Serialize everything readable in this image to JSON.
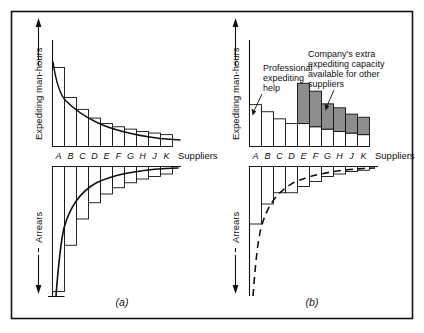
{
  "figure": {
    "frame": {
      "stroke": "#111111"
    },
    "panels": [
      {
        "id": "panel-a",
        "caption": "(a)",
        "top_chart": {
          "ylabel": "Expediting man-hours",
          "xlabel": "Suppliers",
          "categories": [
            "A",
            "B",
            "C",
            "D",
            "E",
            "F",
            "G",
            "H",
            "J",
            "K"
          ],
          "values": [
            100,
            62,
            47,
            36,
            29,
            25,
            22,
            19,
            17,
            15
          ],
          "curve": "smooth decreasing hyperbola overlaying bar tops",
          "type": "bar"
        },
        "bottom_chart": {
          "ylabel": "Arrears",
          "categories": [
            "A",
            "B",
            "C",
            "D",
            "E",
            "F",
            "G",
            "H",
            "J",
            "K"
          ],
          "values": [
            100,
            63,
            42,
            29,
            22,
            17,
            13,
            10,
            8,
            6
          ],
          "curve": "smooth decreasing hyperbola overlaying bar tips",
          "direction": "downward",
          "type": "bar"
        }
      },
      {
        "id": "panel-b",
        "caption": "(b)",
        "top_chart": {
          "ylabel": "Expediting man-hours",
          "xlabel": "Suppliers",
          "categories": [
            "A",
            "B",
            "C",
            "D",
            "E",
            "F",
            "G",
            "H",
            "J",
            "K"
          ],
          "base_values": [
            53,
            44,
            35,
            29,
            29,
            25,
            22,
            19,
            17,
            15
          ],
          "extra_values": [
            0,
            0,
            0,
            0,
            51,
            45,
            32,
            30,
            24,
            22
          ],
          "stack_legend": {
            "base": "expediting man-hours used",
            "extra": "Company's extra expediting capacity available for other suppliers"
          },
          "annotations": [
            {
              "name": "professional-expediting-help",
              "text": "Professional\nexpediting\nhelp",
              "lines": [
                "Professional",
                "expediting",
                "help"
              ],
              "target_bar": "A"
            },
            {
              "name": "companys-extra-capacity",
              "text": "Company's extra expediting capacity available for other suppliers",
              "lines": [
                "Company's extra",
                "expediting capacity",
                "available for other",
                "suppliers"
              ],
              "target_bar": "G"
            }
          ],
          "type": "bar"
        },
        "bottom_chart": {
          "ylabel": "Arrears",
          "categories": [
            "A",
            "B",
            "C",
            "D",
            "E",
            "F",
            "G",
            "H",
            "J",
            "K"
          ],
          "values": [
            46,
            30,
            21,
            21,
            16,
            12,
            8,
            6,
            4,
            3
          ],
          "reference_curve": {
            "style": "dashed",
            "label": "original arrears curve from (a)",
            "values": [
              100,
              63,
              42,
              29,
              22,
              17,
              13,
              10,
              8,
              6
            ]
          },
          "direction": "downward",
          "type": "bar"
        }
      }
    ],
    "colors": {
      "line": "#111111",
      "bar_fill": "#ffffff",
      "shaded_fill": "#8d8d8d",
      "background": "#ffffff"
    }
  },
  "chart_data": [
    {
      "type": "bar",
      "title": "(a) Expediting man-hours by supplier",
      "xlabel": "Suppliers",
      "ylabel": "Expediting man-hours",
      "categories": [
        "A",
        "B",
        "C",
        "D",
        "E",
        "F",
        "G",
        "H",
        "J",
        "K"
      ],
      "values": [
        100,
        62,
        47,
        36,
        29,
        25,
        22,
        19,
        17,
        15
      ],
      "ylim": [
        0,
        110
      ],
      "grid": false,
      "legend": "none",
      "annotations": [
        "smooth fitted decay curve over bar tops"
      ]
    },
    {
      "type": "bar",
      "title": "(a) Arrears by supplier",
      "xlabel": "Suppliers",
      "ylabel": "Arrears",
      "categories": [
        "A",
        "B",
        "C",
        "D",
        "E",
        "F",
        "G",
        "H",
        "J",
        "K"
      ],
      "values": [
        100,
        63,
        42,
        29,
        22,
        17,
        13,
        10,
        8,
        6
      ],
      "ylim": [
        0,
        110
      ],
      "grid": false,
      "legend": "none",
      "annotations": [
        "bars descend below axis",
        "smooth fitted decay curve"
      ]
    },
    {
      "type": "bar",
      "title": "(b) Expediting man-hours by supplier with extra capacity",
      "xlabel": "Suppliers",
      "ylabel": "Expediting man-hours",
      "categories": [
        "A",
        "B",
        "C",
        "D",
        "E",
        "F",
        "G",
        "H",
        "J",
        "K"
      ],
      "series": [
        {
          "name": "Expediting man-hours used",
          "values": [
            53,
            44,
            35,
            29,
            29,
            25,
            22,
            19,
            17,
            15
          ]
        },
        {
          "name": "Company's extra expediting capacity available for other suppliers",
          "values": [
            0,
            0,
            0,
            0,
            51,
            45,
            32,
            30,
            24,
            22
          ]
        }
      ],
      "stacked": true,
      "ylim": [
        0,
        110
      ],
      "grid": false,
      "legend": "annotation labels",
      "annotations": [
        "Professional expediting help → bar A",
        "Company's extra expediting capacity available for other suppliers → shaded tops"
      ]
    },
    {
      "type": "bar",
      "title": "(b) Arrears by supplier after professional expediting",
      "xlabel": "Suppliers",
      "ylabel": "Arrears",
      "categories": [
        "A",
        "B",
        "C",
        "D",
        "E",
        "F",
        "G",
        "H",
        "J",
        "K"
      ],
      "values": [
        46,
        30,
        21,
        21,
        16,
        12,
        8,
        6,
        4,
        3
      ],
      "reference_series": {
        "name": "Original arrears curve (a)",
        "style": "dashed",
        "values": [
          100,
          63,
          42,
          29,
          22,
          17,
          13,
          10,
          8,
          6
        ]
      },
      "ylim": [
        0,
        110
      ],
      "grid": false,
      "legend": "none",
      "annotations": [
        "dashed curve shows previous arrears level"
      ]
    }
  ]
}
